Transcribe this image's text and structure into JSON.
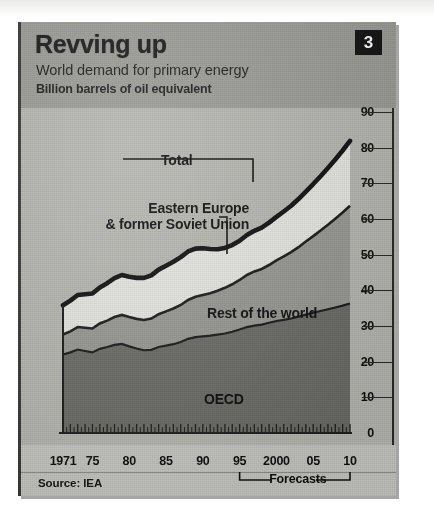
{
  "figure": {
    "title": "Revving up",
    "subtitle": "World demand for primary energy",
    "units": "Billion barrels of oil equivalent",
    "badge": "3",
    "source": "Source: IEA",
    "forecast_label": "Forecasts"
  },
  "colors": {
    "header_band": "#9e9e99",
    "plot_background": "#b9b9b4",
    "oecd": "#6d6d68",
    "rest_of_world": "#9a9a95",
    "eastern_europe": "#e8e8e4",
    "total_line": "#111111",
    "badge_background": "#141414",
    "badge_text": "#ffffff",
    "axis": "#2a2a28",
    "text": "#111111"
  },
  "chart_data": {
    "type": "area",
    "title": "Revving up",
    "subtitle": "World demand for primary energy",
    "ylabel": "Billion barrels of oil equivalent",
    "xlabel": "",
    "ylim": [
      0,
      90
    ],
    "ytick_values": [
      0,
      10,
      20,
      30,
      40,
      50,
      60,
      70,
      80,
      90
    ],
    "ytick_labels": [
      "0",
      "10",
      "20",
      "30",
      "40",
      "50",
      "60",
      "70",
      "80",
      "90"
    ],
    "xlim": [
      1971,
      2010
    ],
    "xtick_values": [
      1971,
      1975,
      1980,
      1985,
      1990,
      1995,
      2000,
      2005,
      2010
    ],
    "xtick_labels": [
      "1971",
      "75",
      "80",
      "85",
      "90",
      "95",
      "2000",
      "05",
      "10"
    ],
    "grid": false,
    "stacked": true,
    "legend_position": "in-plot annotations",
    "forecast_start": 1995,
    "forecast_end": 2010,
    "x": [
      1971,
      1972,
      1973,
      1974,
      1975,
      1976,
      1977,
      1978,
      1979,
      1980,
      1981,
      1982,
      1983,
      1984,
      1985,
      1986,
      1987,
      1988,
      1989,
      1990,
      1991,
      1992,
      1993,
      1994,
      1995,
      1996,
      1997,
      1998,
      1999,
      2000,
      2001,
      2002,
      2003,
      2004,
      2005,
      2006,
      2007,
      2008,
      2009,
      2010
    ],
    "series": [
      {
        "name": "OECD",
        "label": "OECD",
        "color": "#6d6d68",
        "values": [
          22.0,
          22.6,
          23.4,
          23.0,
          22.6,
          23.6,
          24.1,
          24.7,
          25.0,
          24.3,
          23.7,
          23.2,
          23.3,
          24.1,
          24.5,
          24.9,
          25.5,
          26.4,
          26.9,
          27.1,
          27.3,
          27.6,
          27.9,
          28.4,
          29.0,
          29.7,
          30.1,
          30.4,
          30.9,
          31.4,
          31.7,
          32.1,
          32.6,
          33.2,
          33.7,
          34.2,
          34.7,
          35.2,
          35.7,
          36.3
        ]
      },
      {
        "name": "Rest of the world",
        "label": "Rest of the world",
        "color": "#9a9a95",
        "values": [
          5.6,
          5.9,
          6.3,
          6.5,
          6.7,
          7.1,
          7.4,
          7.8,
          8.1,
          8.2,
          8.3,
          8.5,
          8.8,
          9.2,
          9.6,
          10.0,
          10.4,
          10.9,
          11.3,
          11.6,
          11.9,
          12.3,
          12.8,
          13.3,
          13.9,
          14.6,
          15.2,
          15.6,
          16.2,
          17.0,
          17.8,
          18.6,
          19.5,
          20.5,
          21.5,
          22.6,
          23.7,
          24.9,
          26.1,
          27.4
        ]
      },
      {
        "name": "Eastern Europe & former Soviet Union",
        "label": "Eastern Europe\n& former Soviet Union",
        "color": "#e8e8e4",
        "values": [
          8.2,
          8.6,
          9.0,
          9.4,
          9.8,
          10.1,
          10.5,
          10.9,
          11.2,
          11.3,
          11.5,
          11.8,
          12.1,
          12.5,
          12.8,
          13.1,
          13.4,
          13.6,
          13.5,
          13.1,
          12.4,
          11.6,
          11.2,
          11.0,
          11.0,
          11.2,
          11.4,
          11.6,
          11.9,
          12.2,
          12.6,
          13.0,
          13.5,
          14.0,
          14.6,
          15.2,
          15.9,
          16.6,
          17.4,
          18.2
        ]
      }
    ],
    "total": {
      "name": "Total",
      "label": "Total",
      "color": "#111111",
      "values": [
        35.8,
        37.1,
        38.7,
        38.9,
        39.1,
        40.8,
        42.0,
        43.4,
        44.3,
        43.8,
        43.5,
        43.5,
        44.2,
        45.8,
        46.9,
        48.0,
        49.3,
        50.9,
        51.7,
        51.8,
        51.6,
        51.5,
        51.9,
        52.7,
        53.9,
        55.5,
        56.7,
        57.6,
        59.0,
        60.6,
        62.1,
        63.7,
        65.6,
        67.7,
        69.8,
        72.0,
        74.3,
        76.7,
        79.2,
        81.9
      ]
    }
  }
}
